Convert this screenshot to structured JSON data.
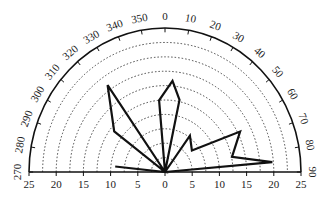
{
  "chart_data": {
    "type": "polar",
    "title": "",
    "angular_axis": {
      "unit": "degrees",
      "range": [
        270,
        90
      ],
      "direction": "clockwise",
      "zero_position": "top",
      "tick_labels": [
        "270",
        "280",
        "290",
        "300",
        "310",
        "320",
        "330",
        "340",
        "350",
        "0",
        "10",
        "20",
        "30",
        "40",
        "50",
        "60",
        "70",
        "80",
        "90"
      ]
    },
    "radial_axis": {
      "range": [
        0,
        25
      ],
      "tick_labels_left": [
        "25",
        "20",
        "15",
        "10",
        "5",
        "0"
      ],
      "tick_labels_right": [
        "5",
        "10",
        "15",
        "20",
        "25"
      ],
      "gridlines": [
        2.5,
        5,
        7.5,
        10,
        12.5,
        15,
        17.5,
        20,
        22.5
      ],
      "grid_style": "dotted"
    },
    "series": [
      {
        "name": "rose",
        "closed": true,
        "points": [
          {
            "angle": 276,
            "r": 9.2
          },
          {
            "angle": 0,
            "r": 0
          },
          {
            "angle": 307,
            "r": 11.7
          },
          {
            "angle": 325,
            "r": 18.4
          },
          {
            "angle": 0,
            "r": 0
          },
          {
            "angle": 355,
            "r": 12.5
          },
          {
            "angle": 5,
            "r": 15.9
          },
          {
            "angle": 12,
            "r": 12.8
          },
          {
            "angle": 0,
            "r": 0
          },
          {
            "angle": 36,
            "r": 7.8
          },
          {
            "angle": 53,
            "r": 6.2
          },
          {
            "angle": 63,
            "r": 15.5
          },
          {
            "angle": 78,
            "r": 12.6
          },
          {
            "angle": 85,
            "r": 19.8
          },
          {
            "angle": 0,
            "r": 0
          }
        ]
      }
    ]
  }
}
